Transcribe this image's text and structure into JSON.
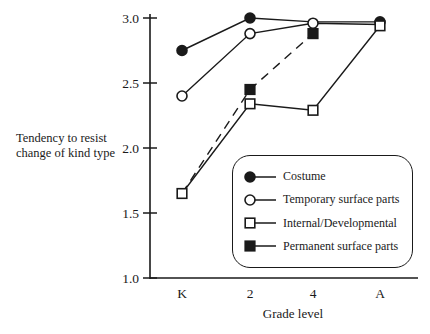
{
  "figure": {
    "background": "#ffffff",
    "ink_color": "#1a1a1a"
  },
  "chart_data": {
    "type": "line",
    "title": "",
    "xlabel": "Grade level",
    "ylabel": "Tendency to resist change of kind type",
    "categories": [
      "K",
      "2",
      "4",
      "A"
    ],
    "ylim": [
      1.0,
      3.0
    ],
    "yticks": [
      3.0,
      2.5,
      2.0,
      1.5,
      1.0
    ],
    "grid": "off",
    "legend_position": "inside lower right",
    "series": [
      {
        "name": "Costume",
        "marker": "filled-circle",
        "line": "solid",
        "values": [
          2.75,
          3.0,
          2.97,
          2.97
        ],
        "markers_visible": [
          true,
          true,
          false,
          true
        ]
      },
      {
        "name": "Temporary surface parts",
        "marker": "open-circle",
        "line": "solid",
        "values": [
          2.4,
          2.88,
          2.96,
          2.95
        ],
        "markers_visible": [
          true,
          true,
          true,
          false
        ]
      },
      {
        "name": "Internal/Developmental",
        "marker": "open-square",
        "line": "solid",
        "values": [
          1.65,
          2.34,
          2.29,
          2.94
        ],
        "markers_visible": [
          true,
          true,
          true,
          true
        ]
      },
      {
        "name": "Permanent surface parts",
        "marker": "filled-square",
        "line": "dashed",
        "values": [
          1.65,
          2.45,
          2.88,
          null
        ],
        "markers_visible": [
          false,
          true,
          true,
          false
        ]
      }
    ]
  }
}
